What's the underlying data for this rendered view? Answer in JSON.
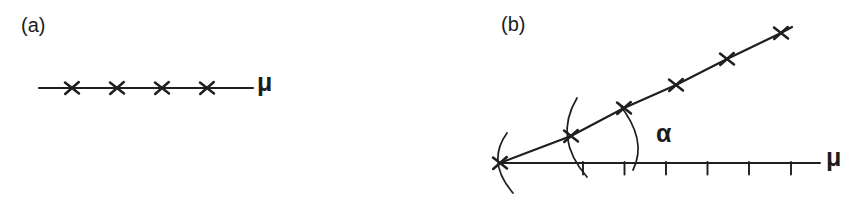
{
  "style": {
    "ink": "#1f1f1f",
    "background": "#ffffff"
  },
  "panel_a": {
    "label": "(a)",
    "axis_label": "μ",
    "marker_symbol": "x-cross",
    "line": {
      "points": [
        [
          39,
          88
        ],
        [
          253,
          88
        ]
      ]
    },
    "markers": [
      [
        72,
        88
      ],
      [
        117,
        88
      ],
      [
        162,
        88
      ],
      [
        207,
        88
      ]
    ]
  },
  "panel_b": {
    "label": "(b)",
    "axis_label": "μ",
    "angle_label": "α",
    "marker_symbol": "x-cross",
    "axis": {
      "points": [
        [
          500,
          163
        ],
        [
          820,
          163
        ]
      ]
    },
    "axis_ticks_x": [
      583,
      624.5,
      666,
      707.5,
      749,
      791
    ],
    "axis_tick_y": [
      162,
      174.5
    ],
    "line": {
      "points": [
        [
          500,
          163
        ],
        [
          571,
          136
        ],
        [
          624,
          108
        ],
        [
          676,
          85
        ],
        [
          727,
          59
        ],
        [
          781,
          33
        ],
        [
          792,
          27
        ]
      ]
    },
    "markers": [
      [
        500,
        163
      ],
      [
        571,
        136
      ],
      [
        624,
        108
      ],
      [
        676,
        85
      ],
      [
        727,
        59
      ],
      [
        781,
        33
      ]
    ],
    "arcs": [
      {
        "name": "pivot-arc-origin",
        "path": "M 507 133 Q 486 162 513 193"
      },
      {
        "name": "pivot-arc-point-2",
        "path": "M 577 98 Q 553 138 587 177"
      },
      {
        "name": "angle-arc",
        "path": "M 619 104 Q 648 140 633 170"
      }
    ]
  }
}
